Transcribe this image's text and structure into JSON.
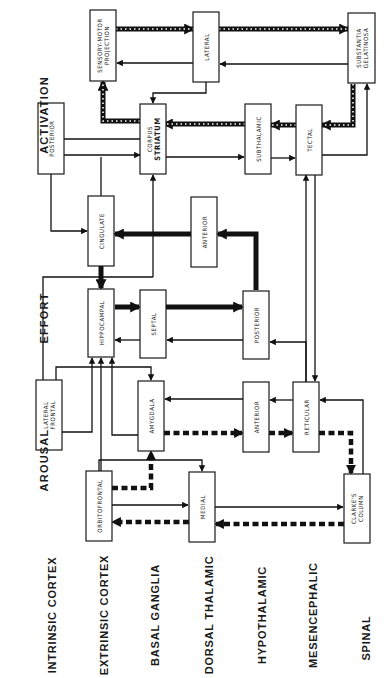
{
  "diagram": {
    "columns": [
      {
        "id": "activation",
        "label": "ACTIVATION"
      },
      {
        "id": "effort",
        "label": "EFFORT"
      },
      {
        "id": "arousal",
        "label": "AROUSAL"
      }
    ],
    "levels": [
      {
        "id": "intrinsic-cortex",
        "label": "INTRINSIC CORTEX"
      },
      {
        "id": "extrinsic-cortex",
        "label": "EXTRINSIC CORTEX"
      },
      {
        "id": "basal-ganglia",
        "label": "BASAL GANGLIA"
      },
      {
        "id": "dorsal-thalamic",
        "label": "DORSAL THALAMIC"
      },
      {
        "id": "hypothalamic",
        "label": "HYPOTHALAMIC"
      },
      {
        "id": "mesencephalic",
        "label": "MESENCEPHALIC"
      },
      {
        "id": "spinal",
        "label": "SPINAL"
      }
    ],
    "nodes": {
      "sensory_motor": {
        "lines": [
          "SENSORY-MOTOR",
          "PROJECTION"
        ]
      },
      "lateral_dt": {
        "lines": [
          "LATERAL"
        ]
      },
      "substantia": {
        "lines": [
          "SUBSTANTIA",
          "GELATINOSA"
        ]
      },
      "posterior_ic": {
        "lines": [
          "POSTERIOR"
        ]
      },
      "corpus_striatum": {
        "lines": [
          "CORPUS",
          "STRIATUM"
        ]
      },
      "subthalamic": {
        "lines": [
          "SUBTHALAMIC"
        ]
      },
      "tectal": {
        "lines": [
          "TECTAL"
        ]
      },
      "cingulate": {
        "lines": [
          "CINGULATE"
        ]
      },
      "anterior_dt": {
        "lines": [
          "ANTERIOR"
        ]
      },
      "hippocampal": {
        "lines": [
          "HIPPOCAMPAL"
        ]
      },
      "septal": {
        "lines": [
          "SEPTAL"
        ]
      },
      "posterior_hy": {
        "lines": [
          "POSTERIOR"
        ]
      },
      "lateral_frontal": {
        "lines": [
          "LATERAL",
          "FRONTAL"
        ]
      },
      "amygdala": {
        "lines": [
          "AMYGDALA"
        ]
      },
      "anterior_hy": {
        "lines": [
          "ANTERIOR"
        ]
      },
      "reticular": {
        "lines": [
          "RETICULAR"
        ]
      },
      "orbitofrontal": {
        "lines": [
          "ORBITOFRONTAL"
        ]
      },
      "medial": {
        "lines": [
          "MEDIAL"
        ]
      },
      "clarkes_column": {
        "lines": [
          "CLARKE'S",
          "COLUMN"
        ]
      }
    },
    "legend": {
      "thin": "thin arrow",
      "thick": "heavy arrow",
      "dashed": "dashed arrow",
      "striped": "striped arrow"
    }
  }
}
